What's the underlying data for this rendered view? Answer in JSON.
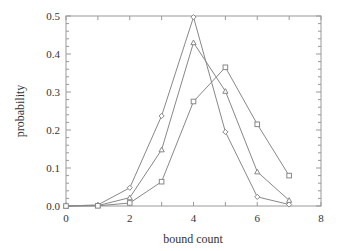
{
  "chart_data": {
    "type": "line",
    "title": "",
    "xlabel": "bound count",
    "ylabel": "probability",
    "xlim": [
      0,
      8
    ],
    "ylim": [
      0,
      0.5
    ],
    "x_ticks": [
      "0",
      "2",
      "4",
      "6",
      "8"
    ],
    "y_ticks": [
      "0.0",
      "0.1",
      "0.2",
      "0.3",
      "0.4",
      "0.5"
    ],
    "grid": false,
    "legend": null,
    "x": [
      0,
      1,
      2,
      3,
      4,
      5,
      6,
      7
    ],
    "series": [
      {
        "name": "diamond",
        "marker": "diamond",
        "values": [
          0.0,
          0.003,
          0.048,
          0.237,
          0.497,
          0.195,
          0.024,
          0.004
        ]
      },
      {
        "name": "triangle",
        "marker": "triangle",
        "values": [
          0.0,
          0.001,
          0.022,
          0.148,
          0.43,
          0.302,
          0.09,
          0.015
        ]
      },
      {
        "name": "square",
        "marker": "square",
        "values": [
          0.0,
          0.0005,
          0.008,
          0.064,
          0.275,
          0.365,
          0.215,
          0.08
        ]
      }
    ],
    "colors": {
      "line": "#888888",
      "frame": "#999999",
      "text": "#333333"
    }
  }
}
